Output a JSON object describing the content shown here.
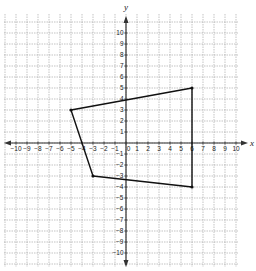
{
  "chart_data": {
    "type": "scatter",
    "title": "",
    "xlabel": "x",
    "ylabel": "y",
    "xlim": [
      -10,
      10
    ],
    "ylim": [
      -10,
      10
    ],
    "grid": true,
    "x_ticks": [
      -10,
      -9,
      -8,
      -7,
      -6,
      -5,
      -4,
      -3,
      -2,
      -1,
      0,
      1,
      2,
      3,
      4,
      5,
      6,
      7,
      8,
      9,
      10
    ],
    "y_ticks": [
      -10,
      -9,
      -8,
      -7,
      -6,
      -5,
      -4,
      -3,
      -2,
      -1,
      1,
      2,
      3,
      4,
      5,
      6,
      7,
      8,
      9,
      10
    ],
    "series": [
      {
        "name": "quadrilateral",
        "closed": true,
        "points": [
          {
            "x": -5,
            "y": 3
          },
          {
            "x": 6,
            "y": 5
          },
          {
            "x": 6,
            "y": -4
          },
          {
            "x": -3,
            "y": -3
          }
        ]
      }
    ]
  },
  "layout": {
    "origin_px": [
      126,
      143
    ],
    "unit_px": 11,
    "grid_px": {
      "left": 4,
      "top": 14,
      "right": 238,
      "bottom": 267
    },
    "colors": {
      "grid": "#9a9a9a",
      "axis": "#333333",
      "polygon": "#111111"
    }
  }
}
